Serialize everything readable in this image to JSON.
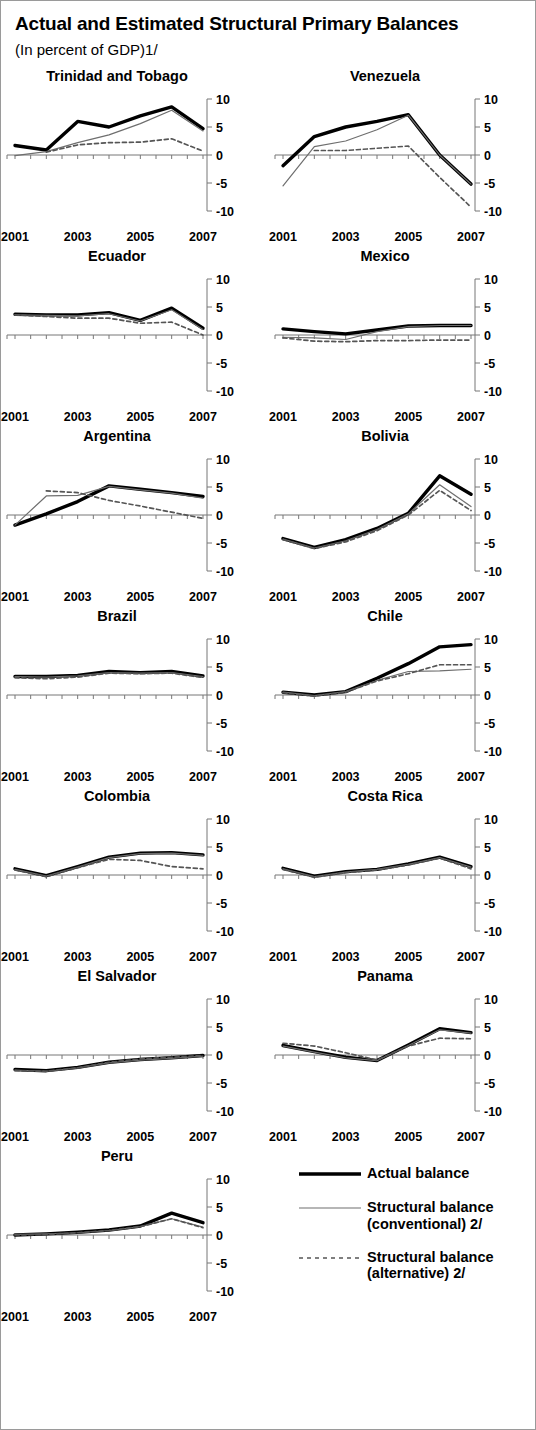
{
  "header": {
    "title": "Actual and Estimated Structural Primary Balances",
    "subtitle": "(In percent of GDP)1/"
  },
  "axis": {
    "y_ticks": [
      "10",
      "5",
      "0",
      "-5",
      "-10"
    ],
    "x_ticks": [
      "2001",
      "2003",
      "2005",
      "2007"
    ]
  },
  "legend": {
    "items": [
      {
        "label": "Actual balance",
        "style": "thick-solid",
        "color": "#000000"
      },
      {
        "label": "Structural balance\n(conventional) 2/",
        "style": "thin-solid",
        "color": "#6e6e6e"
      },
      {
        "label": "Structural balance\n(alternative) 2/",
        "style": "dashed",
        "color": "#555555"
      }
    ]
  },
  "chart_data": {
    "type": "line",
    "title": "Actual and Estimated Structural Primary Balances",
    "subtitle": "(In percent of GDP)1/",
    "xlabel": "",
    "ylabel": "In percent of GDP",
    "x": [
      2001,
      2002,
      2003,
      2004,
      2005,
      2006,
      2007
    ],
    "xlim": [
      2001,
      2007
    ],
    "ylim": [
      -10,
      10
    ],
    "yticks": [
      -10,
      -5,
      0,
      5,
      10
    ],
    "xticks": [
      2001,
      2003,
      2005,
      2007
    ],
    "grid": false,
    "legend_position": "bottom-right",
    "series_names": [
      "Actual balance",
      "Structural balance (conventional) 2/",
      "Structural balance (alternative) 2/"
    ],
    "panels": [
      {
        "name": "Trinidad and Tobago",
        "series": [
          {
            "name": "Actual balance",
            "values": [
              1.7,
              0.9,
              6.0,
              5.0,
              7.0,
              8.6,
              4.7
            ]
          },
          {
            "name": "Structural balance (conventional) 2/",
            "values": [
              -0.1,
              0.6,
              2.2,
              3.6,
              5.6,
              8.0,
              4.3
            ]
          },
          {
            "name": "Structural balance (alternative) 2/",
            "values": [
              null,
              0.5,
              1.8,
              2.2,
              2.3,
              2.9,
              0.7
            ]
          }
        ]
      },
      {
        "name": "Venezuela",
        "series": [
          {
            "name": "Actual balance",
            "values": [
              -1.9,
              3.3,
              5.0,
              6.0,
              7.2,
              0.0,
              -5.2
            ]
          },
          {
            "name": "Structural balance (conventional) 2/",
            "values": [
              -5.5,
              1.5,
              2.5,
              4.5,
              7.1,
              0.0,
              -5.2
            ]
          },
          {
            "name": "Structural balance (alternative) 2/",
            "values": [
              null,
              0.8,
              0.8,
              1.2,
              1.6,
              -4.0,
              -9.3
            ]
          }
        ]
      },
      {
        "name": "Ecuador",
        "series": [
          {
            "name": "Actual balance",
            "values": [
              3.7,
              3.6,
              3.6,
              4.0,
              2.6,
              4.8,
              1.2
            ]
          },
          {
            "name": "Structural balance (conventional) 2/",
            "values": [
              3.6,
              3.5,
              3.4,
              3.8,
              2.5,
              4.5,
              1.0
            ]
          },
          {
            "name": "Structural balance (alternative) 2/",
            "values": [
              3.6,
              3.3,
              3.0,
              3.0,
              2.1,
              2.3,
              0.0
            ]
          }
        ]
      },
      {
        "name": "Mexico",
        "series": [
          {
            "name": "Actual balance",
            "values": [
              1.1,
              0.6,
              0.2,
              0.9,
              1.6,
              1.7,
              1.7
            ]
          },
          {
            "name": "Structural balance (conventional) 2/",
            "values": [
              -0.4,
              -0.5,
              -0.8,
              0.6,
              1.5,
              1.7,
              1.7
            ]
          },
          {
            "name": "Structural balance (alternative) 2/",
            "values": [
              -0.5,
              -1.1,
              -1.2,
              -1.0,
              -1.0,
              -0.9,
              -0.9
            ]
          }
        ]
      },
      {
        "name": "Argentina",
        "series": [
          {
            "name": "Actual balance",
            "values": [
              -1.8,
              0.2,
              2.4,
              5.2,
              4.6,
              4.0,
              3.3
            ]
          },
          {
            "name": "Structural balance (conventional) 2/",
            "values": [
              -1.8,
              3.4,
              3.5,
              5.1,
              4.5,
              3.9,
              3.0
            ]
          },
          {
            "name": "Structural balance (alternative) 2/",
            "values": [
              null,
              4.3,
              4.0,
              2.6,
              1.6,
              0.5,
              -0.6
            ]
          }
        ]
      },
      {
        "name": "Bolivia",
        "series": [
          {
            "name": "Actual balance",
            "values": [
              -4.2,
              -5.8,
              -4.4,
              -2.4,
              0.3,
              7.0,
              3.7
            ]
          },
          {
            "name": "Structural balance (conventional) 2/",
            "values": [
              -4.3,
              -5.9,
              -4.6,
              -2.6,
              0.2,
              5.4,
              1.5
            ]
          },
          {
            "name": "Structural balance (alternative) 2/",
            "values": [
              -4.4,
              -6.0,
              -4.8,
              -2.8,
              0.0,
              4.4,
              0.8
            ]
          }
        ]
      },
      {
        "name": "Brazil",
        "series": [
          {
            "name": "Actual balance",
            "values": [
              3.3,
              3.3,
              3.5,
              4.2,
              4.0,
              4.2,
              3.4
            ]
          },
          {
            "name": "Structural balance (conventional) 2/",
            "values": [
              3.3,
              3.2,
              3.4,
              4.0,
              3.9,
              4.0,
              3.3
            ]
          },
          {
            "name": "Structural balance (alternative) 2/",
            "values": [
              3.1,
              2.9,
              3.2,
              3.9,
              3.8,
              3.9,
              3.1
            ]
          }
        ]
      },
      {
        "name": "Chile",
        "series": [
          {
            "name": "Actual balance",
            "values": [
              0.5,
              0.0,
              0.6,
              3.0,
              5.6,
              8.6,
              9.0
            ]
          },
          {
            "name": "Structural balance (conventional) 2/",
            "values": [
              0.5,
              -0.1,
              0.6,
              2.6,
              4.2,
              4.3,
              4.6
            ]
          },
          {
            "name": "Structural balance (alternative) 2/",
            "values": [
              0.4,
              -0.2,
              0.5,
              2.5,
              3.8,
              5.4,
              5.4
            ]
          }
        ]
      },
      {
        "name": "Colombia",
        "series": [
          {
            "name": "Actual balance",
            "values": [
              1.1,
              -0.1,
              1.5,
              3.2,
              3.9,
              4.0,
              3.6
            ]
          },
          {
            "name": "Structural balance (conventional) 2/",
            "values": [
              1.0,
              -0.2,
              1.4,
              3.1,
              3.8,
              3.9,
              3.5
            ]
          },
          {
            "name": "Structural balance (alternative) 2/",
            "values": [
              0.9,
              -0.3,
              1.3,
              2.8,
              2.6,
              1.5,
              1.1
            ]
          }
        ]
      },
      {
        "name": "Costa Rica",
        "series": [
          {
            "name": "Actual balance",
            "values": [
              1.2,
              -0.2,
              0.6,
              1.0,
              2.0,
              3.2,
              1.5
            ]
          },
          {
            "name": "Structural balance (conventional) 2/",
            "values": [
              1.1,
              -0.3,
              0.5,
              1.0,
              1.9,
              3.1,
              1.4
            ]
          },
          {
            "name": "Structural balance (alternative) 2/",
            "values": [
              1.0,
              -0.4,
              0.4,
              0.9,
              1.8,
              3.0,
              1.1
            ]
          }
        ]
      },
      {
        "name": "El Salvador",
        "series": [
          {
            "name": "Actual balance",
            "values": [
              -2.6,
              -2.8,
              -2.2,
              -1.3,
              -0.8,
              -0.5,
              -0.1
            ]
          },
          {
            "name": "Structural balance (conventional) 2/",
            "values": [
              -2.7,
              -2.9,
              -2.3,
              -1.4,
              -0.9,
              -0.6,
              -0.2
            ]
          },
          {
            "name": "Structural balance (alternative) 2/",
            "values": [
              -2.8,
              -2.9,
              -2.3,
              -1.3,
              -0.7,
              -0.4,
              -0.1
            ]
          }
        ]
      },
      {
        "name": "Panama",
        "series": [
          {
            "name": "Actual balance",
            "values": [
              1.7,
              0.6,
              -0.4,
              -1.0,
              1.8,
              4.7,
              4.0
            ]
          },
          {
            "name": "Structural balance (conventional) 2/",
            "values": [
              1.6,
              0.5,
              -0.5,
              -1.0,
              1.7,
              4.5,
              3.9
            ]
          },
          {
            "name": "Structural balance (alternative) 2/",
            "values": [
              2.1,
              1.6,
              0.4,
              -0.9,
              1.6,
              3.0,
              2.9
            ]
          }
        ]
      },
      {
        "name": "Peru",
        "series": [
          {
            "name": "Actual balance",
            "values": [
              0.0,
              0.2,
              0.5,
              0.9,
              1.6,
              3.9,
              2.2
            ]
          },
          {
            "name": "Structural balance (conventional) 2/",
            "values": [
              0.1,
              0.2,
              0.4,
              0.8,
              1.5,
              2.9,
              1.4
            ]
          },
          {
            "name": "Structural balance (alternative) 2/",
            "values": [
              0.0,
              0.1,
              0.4,
              0.8,
              1.5,
              2.9,
              1.3
            ]
          }
        ]
      }
    ]
  }
}
